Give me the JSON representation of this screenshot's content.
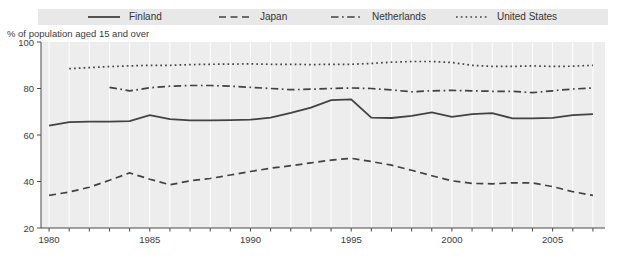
{
  "chart_data": {
    "type": "line",
    "title": "",
    "note": "% of population aged 15 and over",
    "legend_position": "top",
    "grid": "vertical-yearly-white",
    "x": {
      "min": 1979.6,
      "max": 2007.6,
      "tick_years_start": 1980,
      "tick_years_end": 2007,
      "label_years": [
        1980,
        1985,
        1990,
        1995,
        2000,
        2005
      ]
    },
    "y": {
      "min": 20,
      "max": 100,
      "ticks": [
        20,
        40,
        60,
        80,
        100
      ]
    },
    "series": [
      {
        "name": "Finland",
        "line_style": "solid",
        "start_year": 1980,
        "values": [
          64,
          65.5,
          65.7,
          65.7,
          66,
          68.5,
          66.8,
          66.3,
          66.3,
          66.4,
          66.6,
          67.5,
          69.5,
          71.8,
          75,
          75.3,
          67.5,
          67.3,
          68.2,
          69.7,
          67.8,
          69,
          69.4,
          67.2,
          67.2,
          67.4,
          68.5,
          69
        ]
      },
      {
        "name": "Japan",
        "line_style": "dashed",
        "start_year": 1980,
        "values": [
          34,
          35.5,
          37.5,
          40.5,
          43.7,
          41,
          38.6,
          40.3,
          41.3,
          42.8,
          44.3,
          45.7,
          46.8,
          48,
          49.2,
          50,
          48.6,
          47,
          44.8,
          42.5,
          40.3,
          39.2,
          39,
          39.4,
          39.4,
          37.8,
          35.6,
          34
        ]
      },
      {
        "name": "Netherlands",
        "line_style": "dashdot",
        "start_year": 1983,
        "values": [
          80.5,
          79,
          80.3,
          81,
          81.3,
          81.3,
          81,
          80.5,
          80,
          79.5,
          79.7,
          80,
          80.2,
          80,
          79.4,
          78.6,
          79,
          79.2,
          79,
          78.8,
          78.8,
          78.2,
          79,
          79.8,
          80.2
        ]
      },
      {
        "name": "United States",
        "line_style": "dotted",
        "start_year": 1981,
        "values": [
          88.5,
          89,
          89.4,
          89.7,
          90,
          90,
          90.3,
          90.4,
          90.5,
          90.6,
          90.4,
          90.4,
          90.3,
          90.4,
          90.4,
          90.8,
          91.3,
          91.6,
          91.6,
          91.2,
          90,
          89.5,
          89.5,
          89.7,
          89.5,
          89.6,
          90
        ]
      }
    ],
    "colors": {
      "line": "#424242",
      "plot_bg": "#ededed",
      "grid": "#ffffff",
      "axis": "#4a4a4a",
      "text": "#3b3b3b",
      "legend_bg": "#e8e8e8"
    }
  }
}
